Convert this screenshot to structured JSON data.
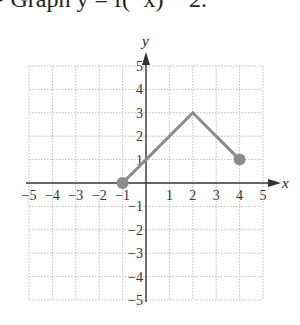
{
  "title": "• Graph y = f(−x) − 2.",
  "chart_data": {
    "type": "line",
    "title": "Graph y = f(−x) − 2.",
    "xlabel": "x",
    "ylabel": "y",
    "xlim": [
      -5,
      5
    ],
    "ylim": [
      -5,
      5
    ],
    "grid": true,
    "x_ticks": [
      "−5",
      "−4",
      "−3",
      "−2",
      "−1",
      "1",
      "2",
      "3",
      "4",
      "5"
    ],
    "y_ticks": [
      "5",
      "4",
      "3",
      "2",
      "1",
      "−1",
      "−2",
      "−3",
      "−4",
      "−5"
    ],
    "series": [
      {
        "name": "f",
        "points": [
          [
            -1,
            0
          ],
          [
            0,
            1
          ],
          [
            2,
            3
          ],
          [
            4,
            1
          ]
        ],
        "endpoints": [
          [
            -1,
            0
          ],
          [
            4,
            1
          ]
        ],
        "color": "#8c8c8c"
      }
    ]
  },
  "colors": {
    "axis": "#333333",
    "grid": "#bdbdbd",
    "curve": "#8c8c8c"
  }
}
